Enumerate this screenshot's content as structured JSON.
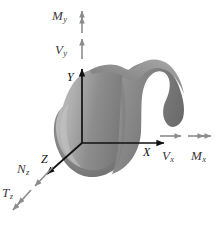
{
  "figure": {
    "type": "diagram",
    "background_color": "#ffffff",
    "axis_color": "#111111",
    "vector_color": "#8c8c8c",
    "label_color": "#3a3a3a",
    "body_color_light": "#b4b4b4",
    "body_color_mid": "#8f8f8f",
    "body_color_dark": "#6e6e6e",
    "origin": {
      "x": 82,
      "y": 143
    }
  },
  "axes": [
    {
      "name": "x-axis",
      "label_base": "X",
      "label_sub": "",
      "direction": "right",
      "tip": {
        "x": 168,
        "y": 143
      },
      "label_pos": {
        "x": 143,
        "y": 147
      }
    },
    {
      "name": "y-axis",
      "label_base": "Y",
      "label_sub": "",
      "direction": "up",
      "tip": {
        "x": 82,
        "y": 65
      },
      "label_pos": {
        "x": 68,
        "y": 72
      }
    },
    {
      "name": "z-axis",
      "label_base": "Z",
      "label_sub": "",
      "direction": "down-left",
      "tip": {
        "x": 44,
        "y": 177
      },
      "label_pos": {
        "x": 42,
        "y": 155
      }
    }
  ],
  "vectors": [
    {
      "name": "shear-force-y",
      "label_base": "V",
      "label_sub": "y",
      "arrowheads": 1,
      "direction": "up",
      "label_pos": {
        "x": 56,
        "y": 42
      },
      "shaft": {
        "x1": 82,
        "y1": 59,
        "x2": 82,
        "y2": 36
      }
    },
    {
      "name": "bending-moment-y",
      "label_base": "M",
      "label_sub": "y",
      "arrowheads": 2,
      "direction": "up",
      "label_pos": {
        "x": 54,
        "y": 8
      },
      "shaft": {
        "x1": 82,
        "y1": 32,
        "x2": 82,
        "y2": 6
      }
    },
    {
      "name": "shear-force-x",
      "label_base": "V",
      "label_sub": "x",
      "arrowheads": 1,
      "direction": "right",
      "label_pos": {
        "x": 163,
        "y": 150
      },
      "shaft": {
        "x1": 160,
        "y1": 136,
        "x2": 184,
        "y2": 136
      }
    },
    {
      "name": "bending-moment-x",
      "label_base": "M",
      "label_sub": "x",
      "arrowheads": 2,
      "direction": "right",
      "label_pos": {
        "x": 192,
        "y": 150
      },
      "shaft": {
        "x1": 188,
        "y1": 136,
        "x2": 214,
        "y2": 136
      }
    },
    {
      "name": "normal-force-z",
      "label_base": "N",
      "label_sub": "z",
      "arrowheads": 1,
      "direction": "down-left",
      "label_pos": {
        "x": 17,
        "y": 162
      },
      "shaft": {
        "x1": 52,
        "y1": 168,
        "x2": 32,
        "y2": 189
      }
    },
    {
      "name": "torsional-moment-z",
      "label_base": "T",
      "label_sub": "z",
      "arrowheads": 2,
      "direction": "down-left",
      "label_pos": {
        "x": 2,
        "y": 186
      },
      "shaft": {
        "x1": 30,
        "y1": 191,
        "x2": 10,
        "y2": 213
      }
    }
  ]
}
